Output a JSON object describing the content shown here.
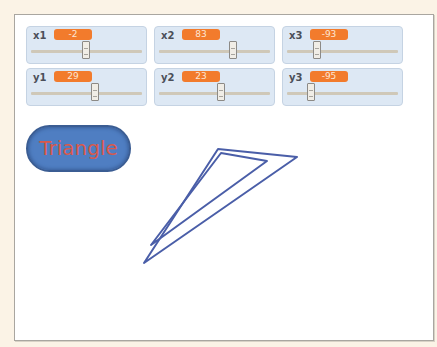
{
  "sliders": [
    {
      "name": "x1",
      "label": "x1",
      "value": "-2",
      "thumb_left": 55
    },
    {
      "name": "x2",
      "label": "x2",
      "value": "83",
      "thumb_left": 74
    },
    {
      "name": "x3",
      "label": "x3",
      "value": "-93",
      "thumb_left": 30
    },
    {
      "name": "y1",
      "label": "y1",
      "value": "29",
      "thumb_left": 64
    },
    {
      "name": "y2",
      "label": "y2",
      "value": "23",
      "thumb_left": 62
    },
    {
      "name": "y3",
      "label": "y3",
      "value": "-95",
      "thumb_left": 24
    }
  ],
  "button": {
    "label": "Triangle"
  },
  "colors": {
    "stage_bg": "#ffffff",
    "page_bg": "#fbf3e6",
    "slider_bg": "#dde8f4",
    "value_badge": "#f27b2c",
    "button_bg": "#4f7ec2",
    "button_text": "#d9594c",
    "triangle_stroke": "#4a5ea8"
  },
  "drawing": {
    "outer_triangle": "203,134 282,142 129,248",
    "inner_triangle": "206,138 252,146 136,230"
  }
}
